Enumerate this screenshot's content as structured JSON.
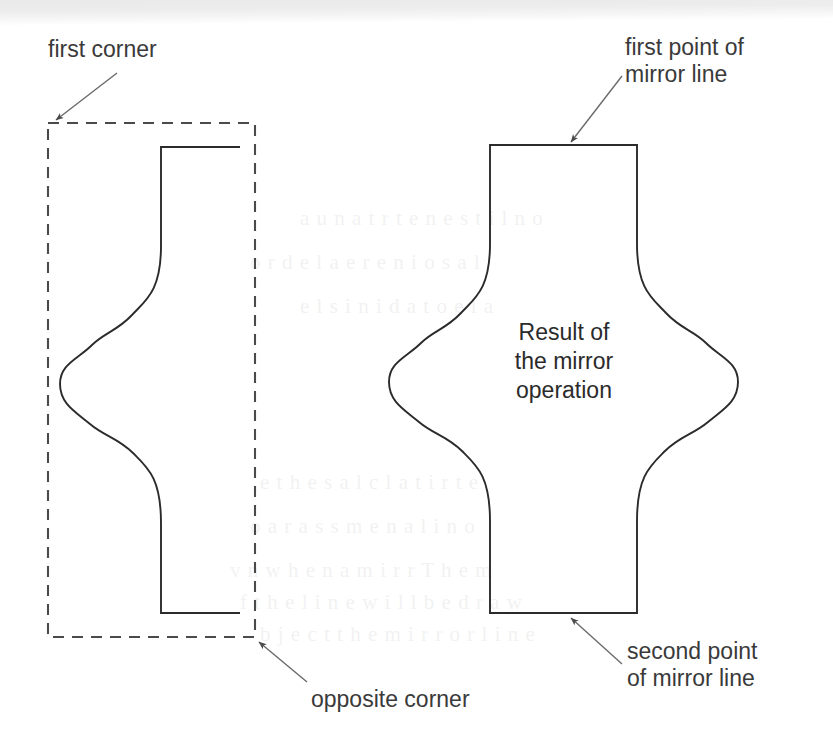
{
  "figure": {
    "width": 833,
    "height": 752,
    "background_color": "#ffffff",
    "stroke_color": "#2b2b2b",
    "text_color": "#3a3a3a",
    "leader_color": "#6b6b6b"
  },
  "labels": {
    "first_corner": "first corner",
    "opposite_corner": "opposite corner",
    "first_point_of_mirror_line": "first point of\nmirror line",
    "second_point_of_mirror_line": "second point\nof mirror line",
    "result_of_the_mirror_operation": "Result of\nthe mirror\noperation"
  },
  "ghost_text": [
    {
      "x": 300,
      "y": 196,
      "text": "a u n a t r  t e n  e s t i l  n o"
    },
    {
      "x": 250,
      "y": 240,
      "text": "o r  d e  l a   e  r e n  i o  s a  l"
    },
    {
      "x": 300,
      "y": 284,
      "text": "e  l   s i n  i d  a  t o  e  l a"
    },
    {
      "x": 260,
      "y": 460,
      "text": "e   t h e   s a  l  c  l a t i  r t  e"
    },
    {
      "x": 250,
      "y": 504,
      "text": "o  a r   a s s  m  e  n a l  i  n  o"
    },
    {
      "x": 230,
      "y": 548,
      "text": "v  n   w h e n  a  m i r  r   T h e  m"
    },
    {
      "x": 240,
      "y": 580,
      "text": "f  t h e  l i  n e  w i l  l   b  e   d r a w"
    },
    {
      "x": 260,
      "y": 612,
      "text": "b  j e c t  t h e  m i r  r o r  l  i n e"
    }
  ],
  "geometry": {
    "dashed_rect": {
      "x": 48,
      "y": 123,
      "width": 207,
      "height": 514
    },
    "left_shape": {
      "top_edge": {
        "x1": 161,
        "y1": 147,
        "x2": 240,
        "y2": 147
      },
      "bottom_edge": {
        "x1": 161,
        "y1": 613,
        "x2": 240,
        "y2": 613
      },
      "profile_leftmost_x": 60,
      "profile_waist_y": 380
    },
    "mirrored_shape": {
      "mirror_line_x": 563,
      "top_edge": {
        "x1": 490,
        "y1": 145,
        "x2": 637,
        "y2": 145
      },
      "bottom_edge": {
        "x1": 490,
        "y1": 613,
        "x2": 637,
        "y2": 613
      },
      "leftmost_x": 388,
      "rightmost_x": 738
    },
    "leaders": [
      {
        "name": "first-corner-leader",
        "x1": 117,
        "y1": 73,
        "x2": 55,
        "y2": 119
      },
      {
        "name": "opposite-corner-leader",
        "x1": 307,
        "y1": 682,
        "x2": 259,
        "y2": 641
      },
      {
        "name": "first-point-leader",
        "x1": 622,
        "y1": 76,
        "x2": 570,
        "y2": 142
      },
      {
        "name": "second-point-leader",
        "x1": 622,
        "y1": 664,
        "x2": 570,
        "y2": 617
      }
    ]
  },
  "label_positions": {
    "first_corner": {
      "left": 48,
      "top": 36
    },
    "opposite_corner": {
      "left": 311,
      "top": 686
    },
    "first_point_of_mirror_line": {
      "left": 625,
      "top": 34
    },
    "second_point_of_mirror_line": {
      "left": 627,
      "top": 638
    },
    "result_of_the_mirror_operation": {
      "left": 459,
      "top": 318,
      "width": 210
    }
  }
}
